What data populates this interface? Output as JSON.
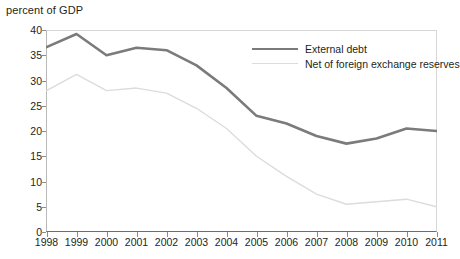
{
  "chart_data": {
    "type": "line",
    "title": "percent of GDP",
    "xlabel": "",
    "ylabel": "",
    "ylim": [
      0,
      40
    ],
    "yticks": [
      0,
      5,
      10,
      15,
      20,
      25,
      30,
      35,
      40
    ],
    "grid": false,
    "legend_position": "top-right",
    "categories": [
      "1998",
      "1999",
      "2000",
      "2001",
      "2002",
      "2003",
      "2004",
      "2005",
      "2006",
      "2007",
      "2008",
      "2009",
      "2010",
      "2011"
    ],
    "series": [
      {
        "name": "External debt",
        "color": "#7b7b7b",
        "width": 2.6,
        "values": [
          36.6,
          39.2,
          35.0,
          36.5,
          36.0,
          33.0,
          28.5,
          23.0,
          21.5,
          19.0,
          17.5,
          18.5,
          20.5,
          20.0
        ]
      },
      {
        "name": "Net of foreign exchange reserves",
        "color": "#dcdcdc",
        "width": 1.4,
        "values": [
          28.0,
          31.2,
          28.0,
          28.5,
          27.5,
          24.5,
          20.5,
          15.0,
          11.0,
          7.5,
          5.5,
          6.0,
          6.5,
          5.0
        ]
      }
    ]
  },
  "axes": {
    "y_tick_labels": [
      "40",
      "35",
      "30",
      "25",
      "20",
      "15",
      "10",
      "5",
      "0"
    ],
    "x_tick_labels": [
      "1998",
      "1999",
      "2000",
      "2001",
      "2002",
      "2003",
      "2004",
      "2005",
      "2006",
      "2007",
      "2008",
      "2009",
      "2010",
      "2011"
    ]
  },
  "legend": {
    "items": [
      {
        "label": "External debt"
      },
      {
        "label": "Net of foreign exchange reserves"
      }
    ]
  }
}
